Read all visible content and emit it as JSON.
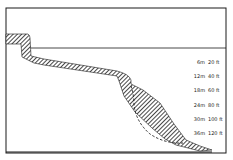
{
  "diagram": {
    "type": "reef-profile-cross-section",
    "colors": {
      "ink": "#1a1a1a",
      "background": "#ffffff"
    },
    "depth_labels": [
      {
        "m": "6m",
        "ft": "20 ft",
        "y": 62
      },
      {
        "m": "12m",
        "ft": "40 ft",
        "y": 76
      },
      {
        "m": "18m",
        "ft": "60 ft",
        "y": 90
      },
      {
        "m": "24m",
        "ft": "80 ft",
        "y": 105
      },
      {
        "m": "30m",
        "ft": "100 ft",
        "y": 119
      },
      {
        "m": "36m",
        "ft": "120 ft",
        "y": 133
      }
    ]
  }
}
